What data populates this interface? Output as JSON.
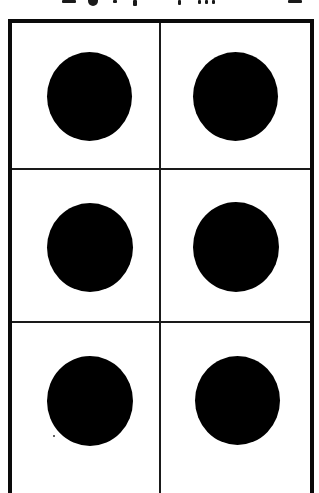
{
  "figure": {
    "type": "braille-cell",
    "grid": {
      "columns": 2,
      "rows": 3
    },
    "colors": {
      "background": "#ffffff",
      "frame": "#0a0a0a",
      "divider": "#1a1a1a",
      "dot": "#000000"
    },
    "cells": [
      {
        "row": 1,
        "col": 1,
        "dot": true,
        "label": "dot-1"
      },
      {
        "row": 1,
        "col": 2,
        "dot": true,
        "label": "dot-4"
      },
      {
        "row": 2,
        "col": 1,
        "dot": true,
        "label": "dot-2"
      },
      {
        "row": 2,
        "col": 2,
        "dot": true,
        "label": "dot-5"
      },
      {
        "row": 3,
        "col": 1,
        "dot": true,
        "label": "dot-3"
      },
      {
        "row": 3,
        "col": 2,
        "dot": true,
        "label": "dot-6"
      }
    ]
  },
  "header_fragment": {
    "visible": true,
    "note": "bottom of a cropped text line, illegible"
  }
}
